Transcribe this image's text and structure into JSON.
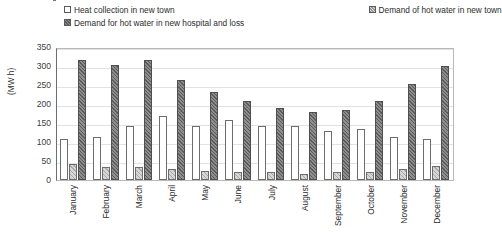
{
  "chart_data": {
    "type": "bar",
    "title": "",
    "xlabel": "",
    "ylabel": "(MW h)",
    "ylim": [
      0,
      350
    ],
    "yticks": [
      0,
      50,
      100,
      150,
      200,
      250,
      300,
      350
    ],
    "grid": true,
    "legend_position": "top",
    "categories": [
      "January",
      "February",
      "March",
      "April",
      "May",
      "June",
      "July",
      "August",
      "September",
      "October",
      "November",
      "December"
    ],
    "series": [
      {
        "name": "Heat collection in new town",
        "swatch": "white",
        "color": "#ffffff",
        "values": [
          107,
          112,
          143,
          168,
          143,
          158,
          143,
          143,
          130,
          133,
          113,
          107
        ]
      },
      {
        "name": "Demand of hot water in new town",
        "swatch": "light-hatch",
        "color": "#d6d6d6",
        "values": [
          43,
          33,
          35,
          28,
          25,
          22,
          20,
          17,
          20,
          22,
          28,
          37
        ]
      },
      {
        "name": "Demand for hot water in new hospital and loss",
        "swatch": "dark-hatch",
        "color": "#8d8d8d",
        "values": [
          315,
          303,
          315,
          262,
          232,
          208,
          190,
          180,
          183,
          208,
          253,
          300
        ]
      }
    ]
  },
  "legend": {
    "items": [
      {
        "label": "Heat collection in new town"
      },
      {
        "label": "Demand of hot water in new town"
      },
      {
        "label": "Demand for hot water in new hospital and loss"
      }
    ]
  },
  "axes": {
    "y_title": "(MW h)"
  }
}
